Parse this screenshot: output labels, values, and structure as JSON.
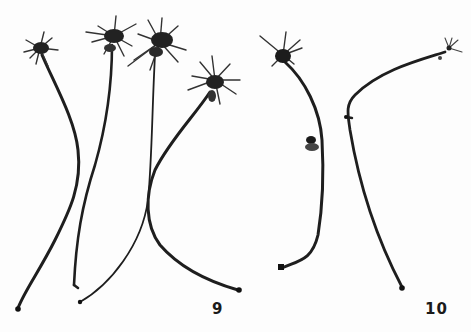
{
  "plate": {
    "background": "#fdfdfd",
    "ink": "#1a1a1a",
    "figures": [
      {
        "label": "9",
        "specimen_count": 4,
        "description": "Four stalked specimens with star-shaped spiky heads"
      },
      {
        "label": "10",
        "specimen_count": 2,
        "description": "Two specimens, one with spiky head and lateral bulb, one with small terminal tuft"
      }
    ]
  },
  "labels": {
    "fig9": "9",
    "fig10": "10"
  }
}
